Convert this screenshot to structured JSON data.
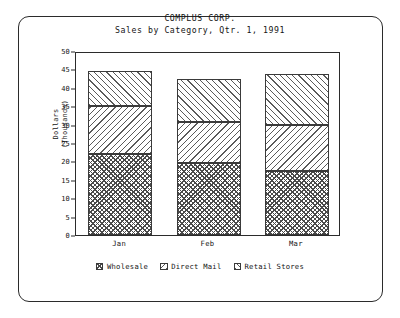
{
  "chart_data": {
    "type": "bar",
    "subtype": "stacked-bar",
    "title": "COMPLUS CORP.",
    "subtitle": "Sales by Category, Qtr. 1, 1991",
    "xlabel": "",
    "ylabel": "Dollars\n(Thousands)",
    "ylabel_lines": [
      "Dollars",
      "(Thousands)"
    ],
    "categories": [
      "Jan",
      "Feb",
      "Mar"
    ],
    "series": [
      {
        "name": "Wholesale",
        "values": [
          22.0,
          19.5,
          17.5
        ],
        "pattern": "crosshatch"
      },
      {
        "name": "Direct Mail",
        "values": [
          13.0,
          11.2,
          12.5
        ],
        "pattern": "backslash-hatch"
      },
      {
        "name": "Retail Stores",
        "values": [
          9.7,
          11.6,
          13.7
        ],
        "pattern": "forwardslash-hatch"
      }
    ],
    "totals": [
      44.7,
      42.3,
      43.7
    ],
    "ylim": [
      0,
      50
    ],
    "ytick_step": 5,
    "yticks": [
      "0",
      "5",
      "10",
      "15",
      "20",
      "25",
      "30",
      "35",
      "40",
      "45",
      "50"
    ],
    "grid": false,
    "legend_position": "bottom",
    "colors": {
      "ink": "#1a1a1a",
      "frame": "#2b2b2b",
      "hatch": "#4a4a4a",
      "background": "#ffffff"
    }
  },
  "legend": {
    "items": [
      {
        "label": "Wholesale"
      },
      {
        "label": "Direct Mail"
      },
      {
        "label": "Retail Stores"
      }
    ]
  }
}
